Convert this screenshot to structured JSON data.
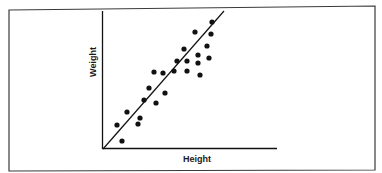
{
  "chart_data": {
    "type": "scatter",
    "title": "",
    "xlabel": "Height",
    "ylabel": "Weight",
    "xlim": [
      0,
      174
    ],
    "ylim": [
      0,
      138
    ],
    "grid": false,
    "legend": null,
    "tick_labels": false,
    "series": [
      {
        "name": "observations",
        "points": [
          [
            14,
            24
          ],
          [
            19,
            8
          ],
          [
            24,
            37
          ],
          [
            35,
            25
          ],
          [
            37,
            31
          ],
          [
            41,
            49
          ],
          [
            46,
            61
          ],
          [
            51,
            77
          ],
          [
            53,
            46
          ],
          [
            60,
            76
          ],
          [
            62,
            56
          ],
          [
            71,
            78
          ],
          [
            74,
            88
          ],
          [
            81,
            100
          ],
          [
            84,
            78
          ],
          [
            92,
            117
          ],
          [
            95,
            94
          ],
          [
            95,
            86
          ],
          [
            97,
            74
          ],
          [
            104,
            103
          ],
          [
            106,
            91
          ],
          [
            108,
            115
          ],
          [
            109,
            127
          ],
          [
            84,
            88
          ]
        ]
      }
    ],
    "trend_line": {
      "type": "linear",
      "from": [
        0,
        0
      ],
      "to": [
        121,
        138
      ]
    },
    "colors": {
      "points": "#111111",
      "axes": "#111111",
      "frame": "#333333"
    }
  },
  "labels": {
    "x_axis": "Height",
    "y_axis": "Weight"
  }
}
